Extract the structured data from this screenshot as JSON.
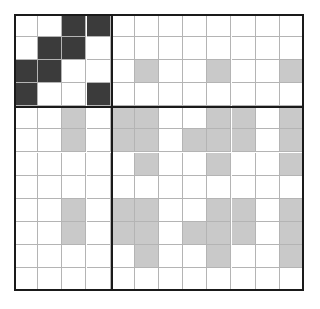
{
  "figure": {
    "type": "matrix-grid",
    "title": "",
    "rows": 12,
    "cols": 12,
    "cell_width_px": 24.1,
    "cell_height_px": 23.0,
    "block_divider_after_col": 3,
    "block_divider_after_row": 3,
    "colors": {
      "background": "#ffffff",
      "empty_cell": "#ffffff",
      "filled_grey": "#c9c9c9",
      "filled_dark": "#3b3b3b",
      "thin_gridline": "#b4b4b4",
      "thick_gridline": "#1a1a1a"
    }
  },
  "chart_data": {
    "type": "heatmap",
    "title": "",
    "xlabel": "",
    "ylabel": "",
    "grid": true,
    "legend": "none",
    "categories_x": [
      "0",
      "1",
      "2",
      "3",
      "4",
      "5",
      "6",
      "7",
      "8",
      "9",
      "10",
      "11"
    ],
    "categories_y": [
      "0",
      "1",
      "2",
      "3",
      "4",
      "5",
      "6",
      "7",
      "8",
      "9",
      "10",
      "11"
    ],
    "value_legend": {
      "0": "empty",
      "1": "grey",
      "2": "dark"
    },
    "values": [
      [
        0,
        0,
        2,
        2,
        0,
        0,
        0,
        0,
        0,
        0,
        0,
        0
      ],
      [
        0,
        2,
        2,
        0,
        0,
        0,
        0,
        0,
        0,
        0,
        0,
        0
      ],
      [
        2,
        2,
        0,
        0,
        0,
        1,
        0,
        0,
        1,
        0,
        0,
        1
      ],
      [
        2,
        0,
        0,
        2,
        0,
        0,
        0,
        0,
        0,
        0,
        0,
        0
      ],
      [
        0,
        0,
        1,
        0,
        1,
        1,
        0,
        0,
        1,
        1,
        0,
        1,
        0
      ],
      [
        0,
        0,
        1,
        0,
        1,
        1,
        0,
        1,
        1,
        1,
        0,
        1
      ],
      [
        0,
        0,
        0,
        0,
        0,
        1,
        0,
        0,
        1,
        0,
        0,
        1
      ],
      [
        0,
        0,
        0,
        0,
        0,
        0,
        0,
        0,
        0,
        0,
        0,
        0
      ],
      [
        0,
        0,
        1,
        0,
        1,
        1,
        0,
        0,
        1,
        1,
        0,
        1
      ],
      [
        0,
        0,
        1,
        0,
        1,
        1,
        0,
        1,
        1,
        1,
        0,
        1
      ],
      [
        0,
        0,
        0,
        0,
        0,
        1,
        0,
        0,
        1,
        0,
        0,
        1
      ],
      [
        0,
        0,
        0,
        0,
        0,
        0,
        0,
        0,
        0,
        0,
        0,
        0
      ]
    ]
  }
}
